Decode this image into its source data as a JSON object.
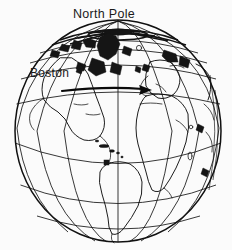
{
  "figure": {
    "type": "map-diagram",
    "background_color": "#fbfbfb",
    "line_color": "#111111"
  },
  "labels": {
    "north_pole": "North Pole",
    "boston": "Boston"
  },
  "annotations": {
    "route": {
      "name": "eastward-great-circle-arrow",
      "from_label": "Boston",
      "direction": "east",
      "start_x": 62,
      "start_y": 91,
      "end_x": 150,
      "end_y": 89
    }
  },
  "globe": {
    "center_x": 118,
    "center_y": 131,
    "radius_x": 103,
    "radius_y": 111,
    "pole_x": 118,
    "pole_y": 31,
    "meridian_count": 7,
    "latitude_count": 6,
    "equator_y": 163
  },
  "features": {
    "continents_visible": [
      "North America",
      "South America",
      "Europe",
      "Africa",
      "Greenland"
    ],
    "cities_marked": [
      "Boston"
    ]
  }
}
